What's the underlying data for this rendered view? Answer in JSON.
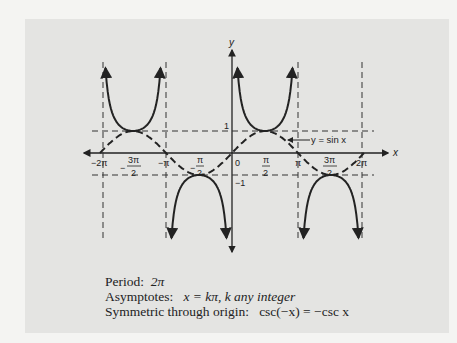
{
  "chart_data": {
    "type": "line",
    "title": "",
    "xlabel": "x",
    "ylabel": "y",
    "x_ticks": [
      "-2π",
      "-3π/2",
      "-π",
      "-π/2",
      "0",
      "π/2",
      "π",
      "3π/2",
      "2π"
    ],
    "y_ticks": [
      "1",
      "-1"
    ],
    "xlim": [
      -6.6,
      7.0
    ],
    "ylim": [
      -4.2,
      4.6
    ],
    "grid": false,
    "series": [
      {
        "name": "y = csc x",
        "style": "solid",
        "function": "1/sin(x)",
        "domain": [
          -6.283,
          6.283
        ]
      },
      {
        "name": "y = sin x",
        "style": "dashed",
        "function": "sin(x)",
        "domain": [
          -6.283,
          6.283
        ]
      }
    ],
    "asymptotes": {
      "x": [
        "-2π",
        "-π",
        "π",
        "2π"
      ],
      "style": "dashed"
    },
    "reference_lines": {
      "y": [
        1,
        -1
      ],
      "style": "dashed"
    },
    "annotations": [
      {
        "text": "y = sin x",
        "points_to": "sin curve near x=2.2"
      }
    ]
  },
  "labels": {
    "y_axis": "y",
    "x_axis": "x",
    "one": "1",
    "minus_one": "−1",
    "zero": "0",
    "sin_label": "y = sin x",
    "neg_two_pi": "−2π",
    "neg_pi": "−π",
    "pi": "π",
    "two_pi": "2π",
    "three_pi_num": "3π",
    "pi_num": "π",
    "den": "2",
    "minus": "−"
  },
  "notes": {
    "period_label": "Period:",
    "period_value": "2π",
    "asymptotes_label": "Asymptotes:",
    "asymptotes_value": "x = kπ, k any integer",
    "symmetry_label": "Symmetric through origin:",
    "symmetry_value": "csc(−x) = −csc x"
  }
}
